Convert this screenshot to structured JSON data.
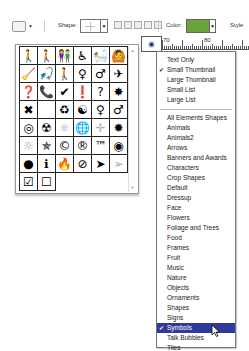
{
  "toolbar": {
    "shape_label": "Shape:",
    "color_label": "Color:",
    "style_label": "Style",
    "color_value": "#6aa33c"
  },
  "ruler": {
    "labels": [
      "70",
      "80"
    ]
  },
  "shape_grid": {
    "rows": [
      [
        "person-walking",
        "person-hiking",
        "couple",
        "wheelchair",
        "bathing",
        "person-arms-out"
      ],
      [
        "person-sweeping",
        "person-fishing",
        "person-walking-2",
        "woman",
        "man",
        "airplane"
      ],
      [
        "question-box",
        "phone-box",
        "checkmark",
        "exclamation",
        "question",
        "splat"
      ],
      [
        "x-mark",
        "",
        "recycle",
        "yin-yang",
        "female-symbol",
        "male-symbol"
      ],
      [
        "target",
        "radioactive",
        "atom",
        "globe",
        "crosshair-light",
        "splat-2"
      ],
      [
        "sun-light",
        "star-outline",
        "copyright",
        "registered",
        "trademark",
        "target-dot"
      ],
      [
        "disc",
        "info",
        "campfire",
        "no-symbol",
        "cursor-arrow",
        "cursor-arrow-outline"
      ],
      [
        "checkbox-checked",
        "checkbox-empty"
      ]
    ],
    "glyphs": [
      [
        "🚶",
        "🚶",
        "👫",
        "♿",
        "🛀",
        "🙆"
      ],
      [
        "🧹",
        "🎣",
        "🚶",
        "♀",
        "♂",
        "✈"
      ],
      [
        "❓",
        "📞",
        "✔",
        "❗",
        "?",
        "✸"
      ],
      [
        "✖",
        "",
        "♻",
        "☯",
        "♀",
        "♂"
      ],
      [
        "◎",
        "☢",
        "⚛",
        "🌐",
        "✛",
        "✹"
      ],
      [
        "☼",
        "✯",
        "©",
        "®",
        "™",
        "◉"
      ],
      [
        "●",
        "ℹ",
        "🔥",
        "⊘",
        "➤",
        "➢"
      ],
      [
        "☑",
        "☐"
      ]
    ]
  },
  "menu": {
    "view_items": [
      {
        "label": "Text Only",
        "checked": false
      },
      {
        "label": "Small Thumbnail",
        "checked": true
      },
      {
        "label": "Large Thumbnail",
        "checked": false
      },
      {
        "label": "Small List",
        "checked": false
      },
      {
        "label": "Large List",
        "checked": false
      }
    ],
    "library_items": [
      {
        "label": "All Elements Shapes"
      },
      {
        "label": "Animals"
      },
      {
        "label": "Animals2"
      },
      {
        "label": "Arrows"
      },
      {
        "label": "Banners and Awards"
      },
      {
        "label": "Characters"
      },
      {
        "label": "Crop Shapes"
      },
      {
        "label": "Default"
      },
      {
        "label": "Dressup"
      },
      {
        "label": "Face"
      },
      {
        "label": "Flowers"
      },
      {
        "label": "Foliage and Trees"
      },
      {
        "label": "Food"
      },
      {
        "label": "Frames"
      },
      {
        "label": "Fruit"
      },
      {
        "label": "Music"
      },
      {
        "label": "Nature"
      },
      {
        "label": "Objects"
      },
      {
        "label": "Ornaments"
      },
      {
        "label": "Shapes"
      },
      {
        "label": "Signs"
      },
      {
        "label": "Symbols",
        "checked": true,
        "highlighted": true
      },
      {
        "label": "Talk Bubbles"
      },
      {
        "label": "Tiles"
      }
    ],
    "check_glyph": "✔",
    "highlight_color": "#2f3a9a"
  }
}
